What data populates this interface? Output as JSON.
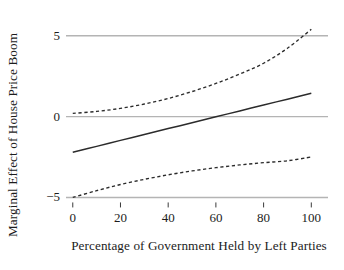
{
  "chart_data": {
    "type": "line",
    "title": "",
    "subtitle": "",
    "xlabel": "Percentage of Government Held by Left Parties",
    "ylabel": "Marginal Effect of House Price Boom",
    "xlim": [
      -2,
      107
    ],
    "ylim": [
      -5.9,
      6.1
    ],
    "xticks": [
      0,
      20,
      40,
      60,
      80,
      100
    ],
    "xtick_labels": [
      "0",
      "20",
      "40",
      "60",
      "80",
      "100"
    ],
    "yticks": [
      5,
      0,
      -5
    ],
    "ytick_labels": [
      "5",
      "0",
      "−5"
    ],
    "grid": true,
    "grid_color": "#b4b4b4",
    "grid_axis": "y",
    "legend": null,
    "legend_position": "none",
    "annotations": [],
    "x": [
      0,
      10,
      20,
      30,
      40,
      50,
      60,
      70,
      80,
      90,
      100
    ],
    "series": [
      {
        "name": "Marginal effect",
        "style": "solid",
        "color": "#2b2b2b",
        "values": [
          -2.2,
          -1.84,
          -1.47,
          -1.11,
          -0.74,
          -0.38,
          -0.01,
          0.35,
          0.72,
          1.08,
          1.45
        ]
      },
      {
        "name": "Upper 95% confidence bound",
        "style": "dashed",
        "color": "#2b2b2b",
        "values": [
          0.2,
          0.32,
          0.51,
          0.78,
          1.12,
          1.55,
          2.05,
          2.63,
          3.3,
          4.23,
          5.4
        ]
      },
      {
        "name": "Lower 95% confidence bound",
        "style": "dashed",
        "color": "#2b2b2b",
        "values": [
          -5.0,
          -4.58,
          -4.2,
          -3.88,
          -3.6,
          -3.36,
          -3.16,
          -2.99,
          -2.85,
          -2.73,
          -2.5
        ]
      }
    ]
  }
}
